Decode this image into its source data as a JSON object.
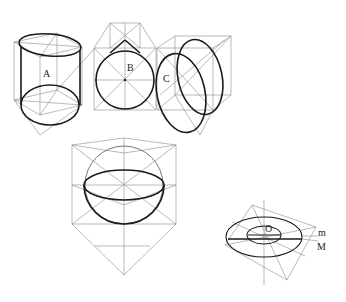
{
  "diagram": {
    "type": "perspective construction drawing",
    "figures": [
      {
        "id": "A",
        "label": "A",
        "description": "vertical cylinder in cube"
      },
      {
        "id": "B",
        "label": "B",
        "description": "sphere/circle in cube"
      },
      {
        "id": "C",
        "label": "C",
        "description": "tilted cylinder in cube"
      },
      {
        "id": "hemisphere",
        "label": "",
        "description": "hemisphere in cube with diamond below"
      },
      {
        "id": "ring",
        "label": "O",
        "description": "flat ring (torus) in rotated square"
      }
    ],
    "ring_labels": {
      "center": "O",
      "inner": "m",
      "outer": "M"
    }
  }
}
